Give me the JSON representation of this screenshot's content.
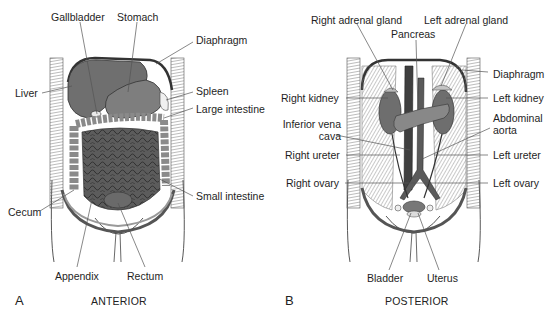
{
  "panels": [
    {
      "letter": "A",
      "view": "ANTERIOR",
      "labels": {
        "gallbladder": "Gallbladder",
        "stomach": "Stomach",
        "diaphragm": "Diaphragm",
        "liver": "Liver",
        "spleen": "Spleen",
        "large_intestine": "Large intestine",
        "small_intestine": "Small intestine",
        "cecum": "Cecum",
        "appendix": "Appendix",
        "rectum": "Rectum"
      }
    },
    {
      "letter": "B",
      "view": "POSTERIOR",
      "labels": {
        "right_adrenal_gland": "Right adrenal gland",
        "left_adrenal_gland": "Left adrenal gland",
        "pancreas": "Pancreas",
        "diaphragm": "Diaphragm",
        "right_kidney": "Right kidney",
        "left_kidney": "Left kidney",
        "inferior_vena_cava_1": "Inferior vena",
        "inferior_vena_cava_2": "cava",
        "abdominal_aorta_1": "Abdominal",
        "abdominal_aorta_2": "aorta",
        "right_ureter": "Right ureter",
        "left_ureter": "Left ureter",
        "right_ovary": "Right ovary",
        "left_ovary": "Left ovary",
        "bladder": "Bladder",
        "uterus": "Uterus"
      }
    }
  ],
  "colors": {
    "organ_dark": "#5a5a5a",
    "organ_mid": "#7c7c7c",
    "organ_light": "#a8a8a8",
    "muscle": "#bdbdbd",
    "leader": "#555555"
  }
}
